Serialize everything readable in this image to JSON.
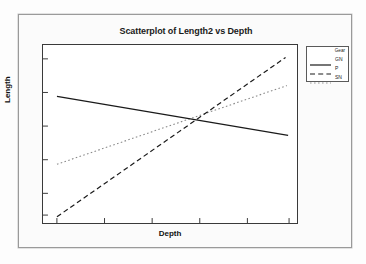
{
  "chart_data": {
    "type": "line",
    "title": "Scatterplot of Length2 vs Depth",
    "xlabel": "Depth",
    "ylabel": "Length",
    "grid": false,
    "legend_position": "right",
    "legend_title": "Gear",
    "x_tick_count": 6,
    "y_tick_count": 6,
    "x_tick_labels": [
      "",
      "",
      "",
      "",
      "",
      ""
    ],
    "y_tick_labels": [
      "",
      "",
      "",
      "",
      "",
      ""
    ],
    "xlim": [
      0,
      1
    ],
    "ylim": [
      0,
      1
    ],
    "series": [
      {
        "name": "GN",
        "style": "solid",
        "color": "#1a1a1a",
        "x": [
          0.055,
          0.965
        ],
        "y": [
          0.712,
          0.492
        ]
      },
      {
        "name": "P",
        "style": "dashed",
        "color": "#1a1a1a",
        "x": [
          0.055,
          0.955
        ],
        "y": [
          0.035,
          0.93
        ]
      },
      {
        "name": "SN",
        "style": "dotted",
        "color": "#8a8a8a",
        "x": [
          0.055,
          0.96
        ],
        "y": [
          0.33,
          0.772
        ]
      }
    ]
  },
  "chart": {
    "title": "Scatterplot of Length2 vs Depth",
    "xlabel": "Depth",
    "ylabel": "Length",
    "legend": {
      "title": "Gear",
      "items": [
        {
          "label": "GN",
          "style": "solid"
        },
        {
          "label": "P",
          "style": "dashed"
        },
        {
          "label": "SN",
          "style": "dotted"
        }
      ]
    }
  }
}
